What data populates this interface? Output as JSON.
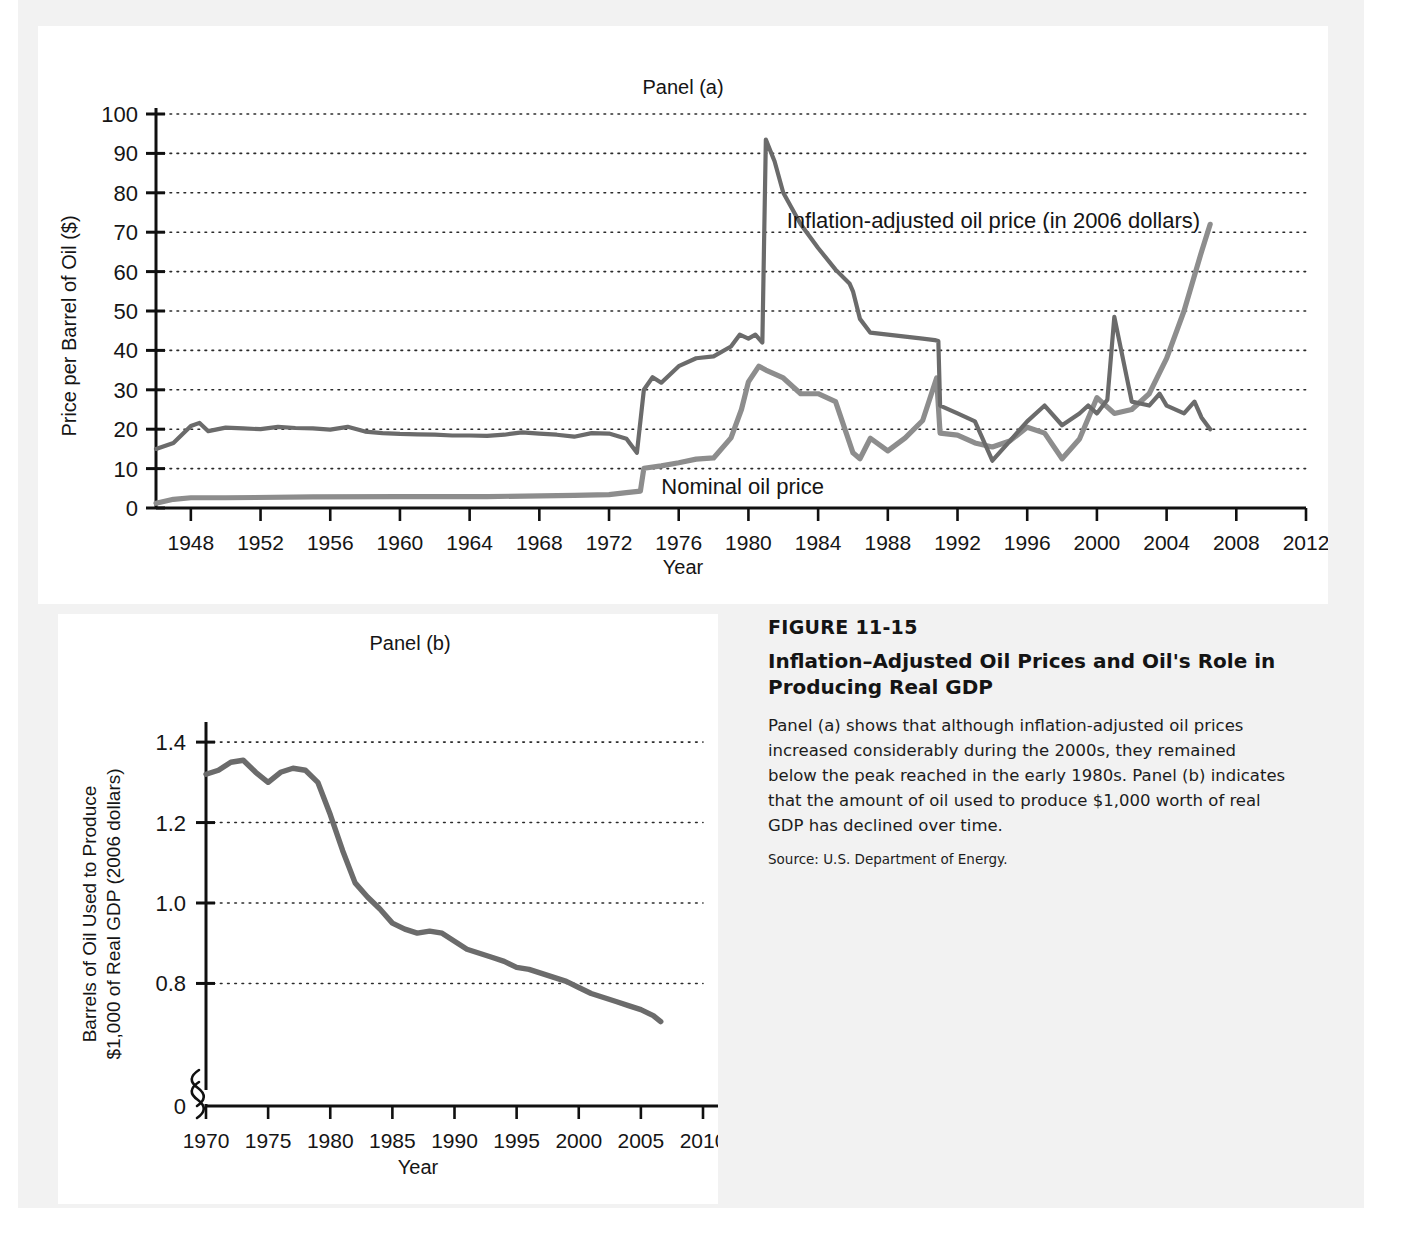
{
  "figure": {
    "number": "FIGURE 11-15",
    "title": "Inflation–Adjusted Oil Prices and Oil's Role in Producing Real GDP",
    "description": "Panel (a) shows that although inflation-adjusted oil prices increased considerably during the 2000s, they remained below the peak reached in the early 1980s. Panel (b) indicates that the amount of oil used to produce $1,000 worth of real GDP has declined over time.",
    "source": "Source: U.S. Department of Energy."
  },
  "chart_data": [
    {
      "type": "line",
      "id": "panel-a",
      "title": "Panel (a)",
      "xlabel": "Year",
      "ylabel": "Price per Barrel of Oil ($)",
      "xlim": [
        1946,
        2012
      ],
      "ylim": [
        0,
        100
      ],
      "xticks": [
        1948,
        1952,
        1956,
        1960,
        1964,
        1968,
        1972,
        1976,
        1980,
        1984,
        1988,
        1992,
        1996,
        2000,
        2004,
        2008,
        2012
      ],
      "yticks": [
        0,
        10,
        20,
        30,
        40,
        50,
        60,
        70,
        80,
        90,
        100
      ],
      "grid": "horizontal-dotted",
      "legend": "inline-annotations",
      "annotations": [
        {
          "text": "Inflation-adjusted oil price (in 2006 dollars)",
          "x": 1982.2,
          "y": 73
        },
        {
          "text": "Nominal oil price",
          "x": 1975.0,
          "y": 5.5
        }
      ],
      "series": [
        {
          "name": "Inflation-adjusted oil price (in 2006 dollars)",
          "color": "#6b6b6b",
          "x": [
            1946,
            1947,
            1948,
            1948.5,
            1949,
            1950,
            1951,
            1952,
            1953,
            1954,
            1955,
            1956,
            1957,
            1958,
            1959,
            1960,
            1961,
            1962,
            1963,
            1964,
            1965,
            1966,
            1967,
            1968,
            1969,
            1970,
            1971,
            1972,
            1973,
            1973.6,
            1974,
            1974.5,
            1975,
            1976,
            1977,
            1978,
            1979,
            1979.5,
            1980,
            1980.4,
            1980.8,
            1981,
            1981.5,
            1982,
            1983,
            1984,
            1985,
            1985.8,
            1986,
            1986.4,
            1987,
            1988,
            1989,
            1990,
            1990.7,
            1990.9,
            1991,
            1992,
            1993,
            1994,
            1995,
            1996,
            1997,
            1998,
            1999,
            1999.5,
            2000,
            2000.6,
            2001,
            2002,
            2003,
            2003.6,
            2004,
            2005,
            2005.6,
            2006,
            2006.5
          ],
          "y": [
            15.0,
            16.5,
            20.8,
            21.6,
            19.5,
            20.4,
            20.2,
            20.0,
            20.6,
            20.3,
            20.2,
            19.9,
            20.6,
            19.4,
            19.0,
            18.8,
            18.7,
            18.6,
            18.4,
            18.4,
            18.3,
            18.6,
            19.2,
            18.9,
            18.6,
            18.1,
            19.0,
            18.9,
            17.6,
            14.0,
            30.0,
            33.2,
            31.8,
            36.0,
            38.0,
            38.5,
            41.0,
            44.0,
            43.0,
            44.0,
            42.0,
            93.5,
            88.0,
            80.0,
            72.0,
            66.0,
            60.5,
            57.0,
            55.0,
            48.0,
            44.5,
            44.0,
            43.5,
            43.0,
            42.6,
            42.4,
            26.0,
            24.0,
            22.0,
            12.0,
            17.0,
            22.0,
            26.0,
            21.0,
            24.0,
            26.0,
            24.0,
            27.5,
            48.5,
            27.0,
            26.0,
            29.0,
            26.0,
            24.0,
            27.0,
            23.0,
            20.0,
            27.0,
            25.0,
            24.0,
            22.0,
            20.0,
            24.0,
            23.0,
            21.0,
            13.0,
            12.5,
            16.0,
            22.0,
            28.0,
            31.0,
            32.0,
            28.0,
            22.0,
            26.0,
            27.0,
            30.0,
            31.0,
            29.0,
            33.0,
            36.0,
            41.0,
            48.0,
            56.0,
            62.0,
            68.0,
            72.5
          ]
        },
        {
          "name": "Nominal oil price",
          "color": "#8d8d8d",
          "x": [
            1946,
            1947,
            1948,
            1950,
            1955,
            1960,
            1965,
            1970,
            1972,
            1973,
            1973.8,
            1974,
            1975,
            1976,
            1977,
            1978,
            1979,
            1979.6,
            1980,
            1980.6,
            1981,
            1982,
            1983,
            1984,
            1985,
            1986,
            1986.4,
            1987,
            1988,
            1989,
            1990,
            1990.8,
            1991,
            1992,
            1993,
            1994,
            1995,
            1996,
            1997,
            1998,
            1999,
            2000,
            2001,
            2002,
            2003,
            2004,
            2005,
            2006,
            2006.5
          ],
          "y": [
            1.2,
            2.2,
            2.6,
            2.6,
            2.8,
            2.9,
            2.9,
            3.2,
            3.4,
            3.9,
            4.3,
            10.1,
            10.7,
            11.5,
            12.4,
            12.7,
            17.8,
            25.0,
            32.0,
            36.0,
            35.0,
            33.0,
            29.0,
            29.0,
            27.0,
            14.0,
            12.5,
            17.7,
            14.5,
            17.8,
            22.2,
            33.0,
            19.0,
            18.5,
            16.5,
            15.5,
            17.0,
            20.5,
            19.0,
            12.5,
            17.5,
            28.0,
            24.0,
            25.0,
            29.0,
            38.0,
            50.0,
            65.0,
            72.0
          ]
        }
      ]
    },
    {
      "type": "line",
      "id": "panel-b",
      "title": "Panel (b)",
      "xlabel": "Year",
      "ylabel": "Barrels of Oil Used to Produce $1,000 of Real GDP (2006 dollars)",
      "xlim": [
        1970,
        2010
      ],
      "ylim": [
        0.55,
        1.45
      ],
      "axis_break": true,
      "xticks": [
        1970,
        1975,
        1980,
        1985,
        1990,
        1995,
        2000,
        2005,
        2010
      ],
      "yticks": [
        0,
        0.8,
        1.0,
        1.2,
        1.4
      ],
      "grid": "horizontal-dotted",
      "series": [
        {
          "name": "Barrels of oil per $1,000 real GDP",
          "color": "#6b6b6b",
          "x": [
            1970,
            1971,
            1972,
            1973,
            1974,
            1975,
            1976,
            1977,
            1978,
            1979,
            1980,
            1981,
            1982,
            1983,
            1984,
            1985,
            1986,
            1987,
            1988,
            1989,
            1990,
            1991,
            1992,
            1993,
            1994,
            1995,
            1996,
            1997,
            1998,
            1999,
            2000,
            2001,
            2002,
            2003,
            2004,
            2005,
            2006,
            2006.6
          ],
          "y": [
            1.32,
            1.33,
            1.35,
            1.355,
            1.325,
            1.3,
            1.325,
            1.335,
            1.33,
            1.3,
            1.22,
            1.13,
            1.05,
            1.015,
            0.985,
            0.95,
            0.935,
            0.925,
            0.93,
            0.925,
            0.905,
            0.885,
            0.875,
            0.865,
            0.855,
            0.84,
            0.835,
            0.825,
            0.815,
            0.805,
            0.79,
            0.775,
            0.765,
            0.755,
            0.745,
            0.735,
            0.72,
            0.705
          ]
        }
      ]
    }
  ]
}
